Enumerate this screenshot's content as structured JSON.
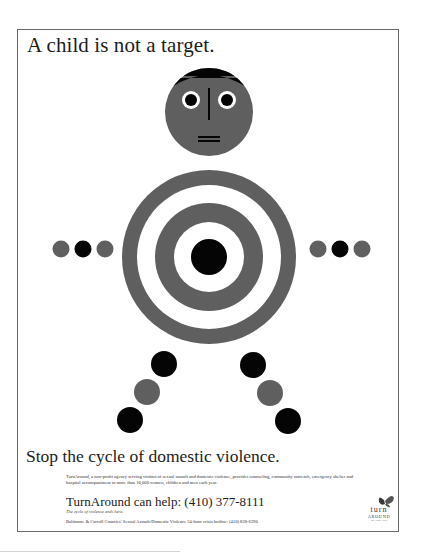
{
  "poster": {
    "headline": "A child is not a target.",
    "tagline": "Stop the cycle of domestic violence.",
    "body": "TurnAround, a non-profit agency serving victims of sexual assault and domestic violence, provides counseling, community outreach, emergency shelter and hospital accompaniment to more than 10,000 women, children and men each year.",
    "help_line": "TurnAround can help: (410) 377-8111",
    "help_subline": "The cycle of violence ends here.",
    "hotline": "Baltimore & Carroll Counties' Sexual Assault/Domestic Violence 24-hour crisis hotline: (410) 828-6390",
    "logo": {
      "line1": "turn",
      "line2": "AROUND",
      "line3": "Inc. Since 1978"
    }
  },
  "illustration": {
    "figure": "target-bodied child",
    "colors": {
      "gray": "#5f5f5f",
      "black": "#050505",
      "white": "#ffffff",
      "frame": "#6a6a6a"
    },
    "arm_dots": [
      "gray",
      "black",
      "gray"
    ],
    "leg_dots": [
      "black",
      "gray",
      "black"
    ]
  }
}
